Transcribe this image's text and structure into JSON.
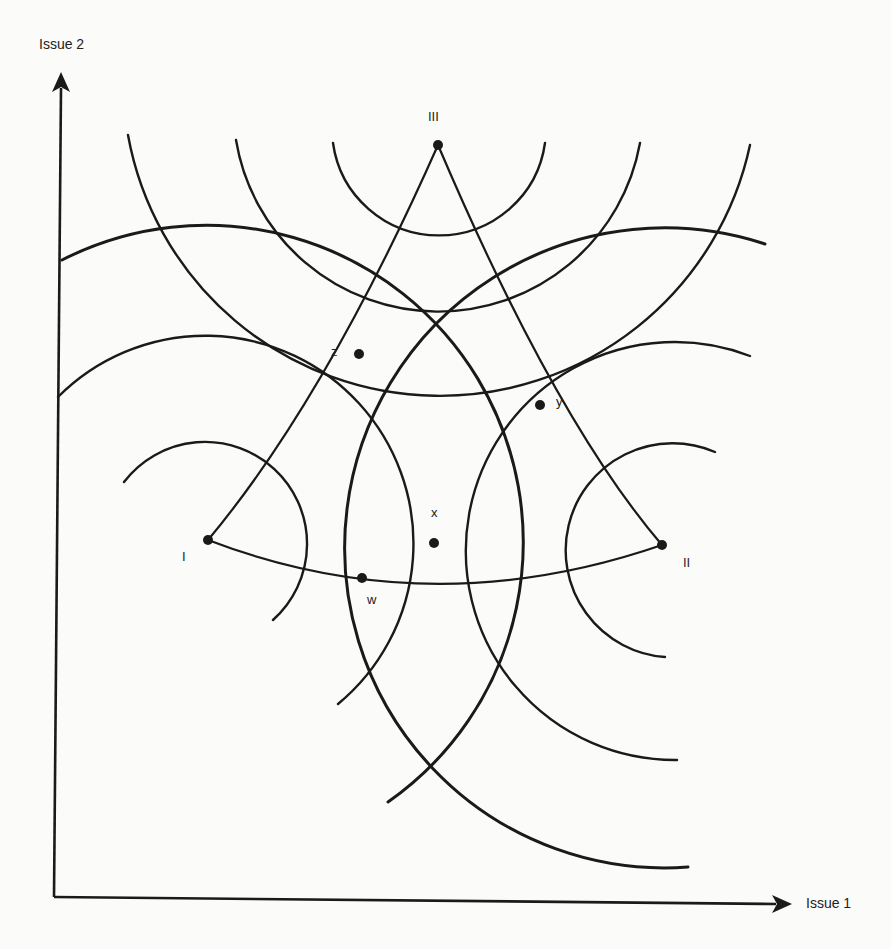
{
  "axes": {
    "x_label": "Issue 1",
    "y_label": "Issue 2",
    "origin": [
      54,
      897
    ],
    "x_end": [
      792,
      904
    ],
    "y_end": [
      61,
      72
    ]
  },
  "ideal_points": [
    {
      "id": "I",
      "label": "I",
      "x": 208,
      "y": 540,
      "label_x": 182,
      "label_y": 550
    },
    {
      "id": "II",
      "label": "II",
      "x": 662,
      "y": 545,
      "label_x": 683,
      "label_y": 556
    },
    {
      "id": "III",
      "label": "III",
      "x": 438,
      "y": 145,
      "label_x": 428,
      "label_y": 110
    }
  ],
  "outcome_points": [
    {
      "id": "z",
      "label": "z",
      "x": 359,
      "y": 354,
      "label_x": 331,
      "label_y": 345
    },
    {
      "id": "y",
      "label": "y",
      "x": 540,
      "y": 405,
      "label_x": 556,
      "label_y": 395
    },
    {
      "id": "x",
      "label": "x",
      "x": 434,
      "y": 543,
      "label_x": 431,
      "label_y": 506
    },
    {
      "id": "w",
      "label": "w",
      "x": 362,
      "y": 578,
      "label_x": 367,
      "label_y": 593
    }
  ],
  "indifference_arcs": [
    {
      "center": "III",
      "r": 107,
      "from": [
        333,
        143
      ],
      "to": [
        545,
        143
      ],
      "large": 0,
      "sweep": 0,
      "w": 2.4
    },
    {
      "center": "III",
      "r": 205,
      "from": [
        236,
        140
      ],
      "to": [
        640,
        143
      ],
      "large": 0,
      "sweep": 0,
      "w": 2.4
    },
    {
      "center": "III",
      "r": 317,
      "from": [
        128,
        135
      ],
      "to": [
        750,
        145
      ],
      "large": 0,
      "sweep": 0,
      "w": 2.4
    },
    {
      "center": "I",
      "r": 102,
      "from": [
        124,
        482
      ],
      "to": [
        273,
        620
      ],
      "large": 1,
      "sweep": 1,
      "w": 2.4
    },
    {
      "center": "I",
      "r": 208,
      "from": [
        58,
        397
      ],
      "to": [
        338,
        704
      ],
      "large": 1,
      "sweep": 1,
      "w": 2.4
    },
    {
      "center": "I",
      "r": 317,
      "from": [
        62,
        260
      ],
      "to": [
        388,
        802
      ],
      "large": 0,
      "sweep": 1,
      "w": 3.0
    },
    {
      "center": "II",
      "r": 107,
      "from": [
        715,
        452
      ],
      "to": [
        665,
        657
      ],
      "large": 1,
      "sweep": 0,
      "w": 2.4
    },
    {
      "center": "II",
      "r": 209,
      "from": [
        750,
        356
      ],
      "to": [
        677,
        760
      ],
      "large": 1,
      "sweep": 0,
      "w": 2.4
    },
    {
      "center": "II",
      "r": 320,
      "from": [
        765,
        244
      ],
      "to": [
        688,
        867
      ],
      "large": 1,
      "sweep": 0,
      "w": 3.0
    }
  ],
  "contract_curves": [
    {
      "name": "I-III",
      "from": [
        208,
        540
      ],
      "ctrl": [
        325,
        400
      ],
      "to": [
        438,
        145
      ]
    },
    {
      "name": "II-III",
      "from": [
        662,
        545
      ],
      "ctrl": [
        555,
        420
      ],
      "to": [
        438,
        145
      ]
    },
    {
      "name": "I-II",
      "from": [
        208,
        540
      ],
      "ctrl": [
        430,
        625
      ],
      "to": [
        662,
        545
      ]
    }
  ],
  "style": {
    "line_color": "#1a1a1a",
    "background": "#fbfbf9"
  }
}
